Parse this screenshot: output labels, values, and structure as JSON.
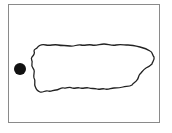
{
  "map": {
    "frame": {
      "x": 8,
      "y": 4,
      "width": 152,
      "height": 119,
      "border_color": "#8a8a8a"
    },
    "island_outline": {
      "label": "",
      "stroke_color": "#222222",
      "fill_color": "#ffffff"
    },
    "marker": {
      "shape": "filled-circle",
      "cx": 20,
      "cy": 69,
      "r": 6,
      "color": "#111111"
    }
  }
}
